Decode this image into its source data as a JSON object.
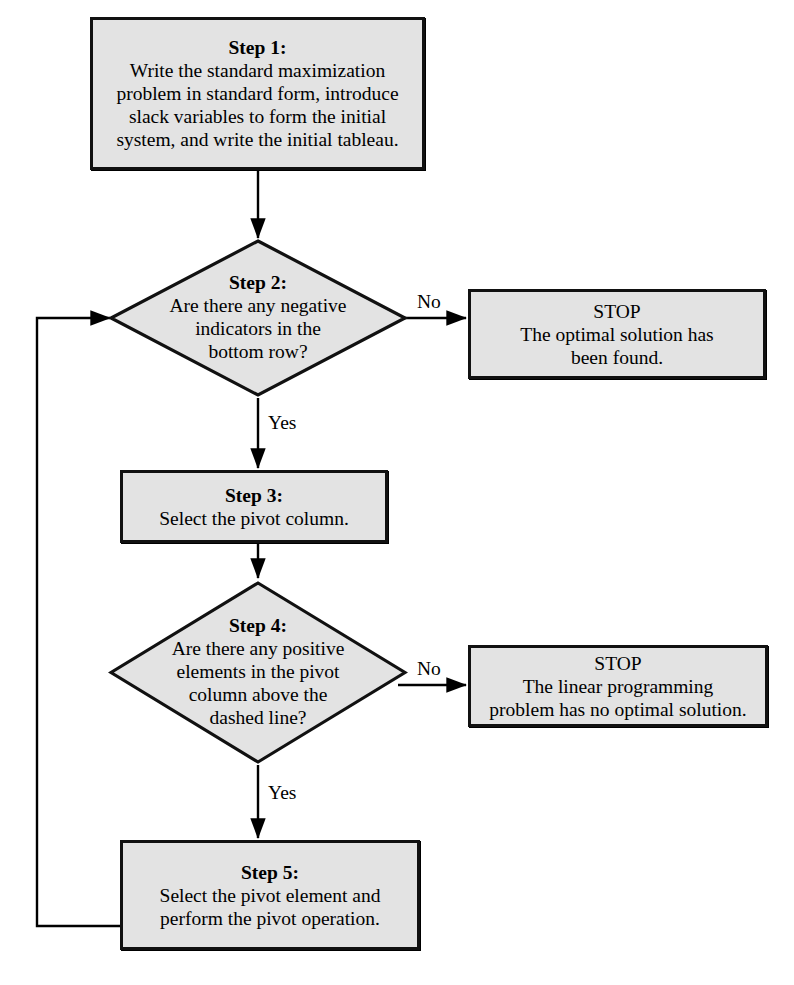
{
  "diagram": {
    "colors": {
      "node_fill": "#e3e3e3",
      "node_stroke": "#111111",
      "connector": "#000000",
      "page_background": "#ffffff"
    }
  },
  "nodes": {
    "step1": {
      "shape": "process",
      "title": "Step 1:",
      "lines": [
        "Write the standard maximization",
        "problem in standard form, introduce",
        "slack variables to form the initial",
        "system, and write the initial tableau."
      ]
    },
    "step2": {
      "shape": "decision",
      "title": "Step 2:",
      "lines": [
        "Are there any negative",
        "indicators in the",
        "bottom row?"
      ]
    },
    "stop_optimal": {
      "shape": "process",
      "title": "STOP",
      "lines": [
        "The optimal solution has",
        "been found."
      ]
    },
    "step3": {
      "shape": "process",
      "title": "Step 3:",
      "lines": [
        "Select the pivot column."
      ]
    },
    "step4": {
      "shape": "decision",
      "title": "Step 4:",
      "lines": [
        "Are there any positive",
        "elements in the pivot",
        "column above the",
        "dashed line?"
      ]
    },
    "stop_no_solution": {
      "shape": "process",
      "title": "STOP",
      "lines": [
        "The linear programming",
        "problem has no optimal solution."
      ]
    },
    "step5": {
      "shape": "process",
      "title": "Step 5:",
      "lines": [
        "Select the pivot element and",
        "perform the pivot operation."
      ]
    }
  },
  "edge_labels": {
    "step2_no": "No",
    "step2_yes": "Yes",
    "step4_no": "No",
    "step4_yes": "Yes"
  }
}
